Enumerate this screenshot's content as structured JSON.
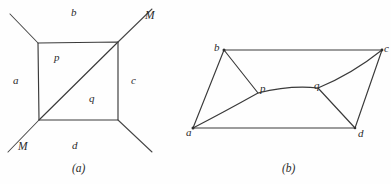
{
  "figure": {
    "background_color": "#fefefe",
    "ink_color": "#3a3a3a",
    "panels": [
      {
        "id": "panel-a",
        "caption": "(a)",
        "caption_x": 72,
        "caption_y": 163,
        "description": "square with diagonal and four external rays",
        "region_labels": [
          {
            "text": "b",
            "x": 71,
            "y": 7
          },
          {
            "text": "a",
            "x": 13,
            "y": 75
          },
          {
            "text": "c",
            "x": 131,
            "y": 75
          },
          {
            "text": "d",
            "x": 72,
            "y": 140
          },
          {
            "text": "p",
            "x": 54,
            "y": 52
          },
          {
            "text": "q",
            "x": 89,
            "y": 93
          }
        ],
        "marked_point_labels": [
          {
            "text": "M",
            "x": 145,
            "y": 10
          },
          {
            "text": "M",
            "x": 18,
            "y": 141
          }
        ],
        "square": {
          "top_left": [
            38,
            43
          ],
          "top_right": [
            118,
            42
          ],
          "bottom_right": [
            118,
            120
          ],
          "bottom_left": [
            39,
            120
          ]
        },
        "diagonal": [
          [
            39,
            120
          ],
          [
            118,
            42
          ]
        ],
        "rays": [
          {
            "from": [
              38,
              43
            ],
            "to": [
              10,
              14
            ]
          },
          {
            "from": [
              118,
              42
            ],
            "to": [
              152,
              9
            ]
          },
          {
            "from": [
              39,
              120
            ],
            "to": [
              8,
              152
            ]
          },
          {
            "from": [
              118,
              120
            ],
            "to": [
              152,
              152
            ]
          }
        ]
      },
      {
        "id": "panel-b",
        "caption": "(b)",
        "caption_x": 282,
        "caption_y": 163,
        "description": "quadrilateral a-b-c-d with interior polyline a-p-q-c and segments b-p, q-d",
        "vertices": [
          {
            "name": "a",
            "x": 193,
            "y": 128,
            "label_x": 186,
            "label_y": 127
          },
          {
            "name": "b",
            "x": 224,
            "y": 50,
            "label_x": 214,
            "label_y": 42
          },
          {
            "name": "c",
            "x": 382,
            "y": 50,
            "label_x": 384,
            "label_y": 43
          },
          {
            "name": "d",
            "x": 355,
            "y": 128,
            "label_x": 358,
            "label_y": 128
          },
          {
            "name": "p",
            "x": 258,
            "y": 93,
            "label_x": 260,
            "label_y": 83
          },
          {
            "name": "q",
            "x": 318,
            "y": 88,
            "label_x": 314,
            "label_y": 80
          }
        ],
        "edges": [
          [
            "a",
            "b"
          ],
          [
            "b",
            "c"
          ],
          [
            "c",
            "d"
          ],
          [
            "a",
            "d"
          ],
          [
            "b",
            "p"
          ],
          [
            "q",
            "d"
          ]
        ],
        "curve_path": "a to p to q to c"
      }
    ]
  }
}
